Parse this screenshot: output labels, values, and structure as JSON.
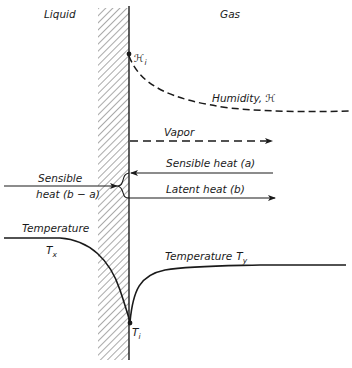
{
  "diagram": {
    "regions": {
      "liquid": "Liquid",
      "gas": "Gas"
    },
    "interface": {
      "humidity_point": {
        "symbol": "ℋ",
        "subscript": "i"
      },
      "temperature_point": {
        "symbol": "T",
        "subscript": "i"
      }
    },
    "curves": {
      "humidity": {
        "label": "Humidity, ℋ",
        "style": "dashed"
      },
      "temperature_liquid": {
        "label_line1": "Temperature",
        "symbol": "T",
        "subscript": "x",
        "style": "solid"
      },
      "temperature_gas": {
        "label": "Temperature",
        "symbol": "T",
        "subscript": "y",
        "style": "solid"
      }
    },
    "arrows": {
      "vapor": {
        "label": "Vapor",
        "direction": "right",
        "style": "dashed"
      },
      "sensible_heat_gas": {
        "label": "Sensible heat (a)",
        "direction": "left",
        "style": "solid"
      },
      "latent_heat": {
        "label": "Latent heat (b)",
        "direction": "right",
        "style": "solid"
      },
      "sensible_heat_liquid": {
        "label_line1": "Sensible",
        "label_line2": "heat (b − a)",
        "direction": "left",
        "style": "solid"
      }
    },
    "colors": {
      "ink": "#1a1a1a",
      "hatch": "#555555",
      "background": "#ffffff"
    }
  }
}
